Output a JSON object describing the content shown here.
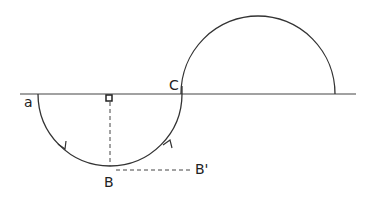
{
  "diagram": {
    "labels": {
      "a": "a",
      "b": "B",
      "c": "C",
      "b_prime": "B'"
    },
    "stroke_color": "#333333",
    "background": "#ffffff"
  }
}
